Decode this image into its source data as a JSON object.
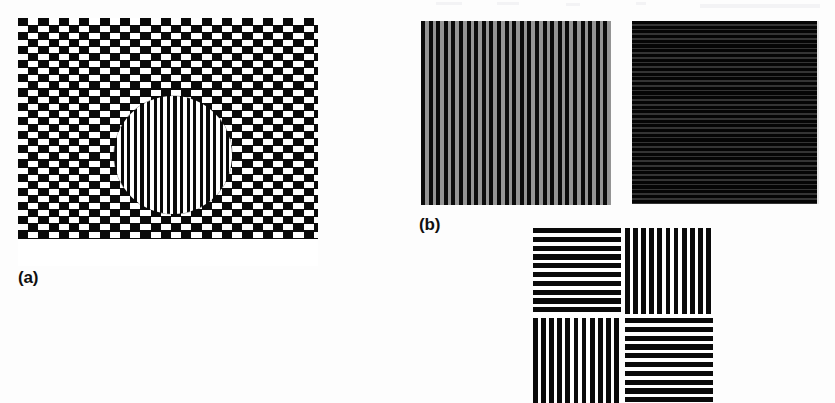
{
  "figure": {
    "background_color": "#fdfdfd",
    "width": 835,
    "height": 403,
    "panel_labels": [
      {
        "id": "a",
        "text": "(a)"
      },
      {
        "id": "b",
        "text": "(b)"
      }
    ]
  },
  "panel_a": {
    "label": "(a)",
    "name": "offset-checkerboard-with-circular-grating-inset",
    "description": "Large offset (cafe-wall style) black and white checkerboard with a circular inset containing a fine vertical square-wave grating",
    "colors": {
      "bar": "#0a0a0a",
      "background": "#ffffff"
    },
    "geometry": {
      "left": 18,
      "top": 18,
      "width": 300,
      "height": 248,
      "cell_width_px": 20.4,
      "row_height_px": 7.1,
      "row_offset_px": 10.2,
      "row_count": 31
    },
    "inset": {
      "shape": "circle",
      "left": 96,
      "top": 78,
      "diameter_px": 118,
      "grating_orientation": "vertical",
      "grating_period_px": 6.6
    }
  },
  "panel_b": {
    "label": "(b)",
    "name": "grating-pair-and-quad",
    "gratings": [
      {
        "id": "vertical-grating-gray",
        "orientation": "vertical",
        "bar_color": "#0b0b0b",
        "background_color": "#949494",
        "period_px": 7.6,
        "bar_count": 25,
        "left": 421,
        "top": 21,
        "width": 190,
        "height": 184
      },
      {
        "id": "horizontal-grating-dark",
        "orientation": "horizontal",
        "bar_color": "#050505",
        "background_color": "#343434",
        "period_px": 4.7,
        "bar_count": 39,
        "left": 632,
        "top": 21,
        "width": 187,
        "height": 183
      }
    ],
    "quad": {
      "id": "orthogonal-grating-quad",
      "description": "Two by two arrangement of square grating patches with alternating orientation",
      "left": 533,
      "top": 228,
      "width": 180,
      "height": 175,
      "cells": [
        {
          "position": "top-left",
          "orientation": "horizontal",
          "period_px": 8.8,
          "bar_count": 10
        },
        {
          "position": "top-right",
          "orientation": "vertical",
          "period_px": 8.1,
          "bar_count": 11
        },
        {
          "position": "bottom-left",
          "orientation": "vertical",
          "period_px": 8.1,
          "bar_count": 11
        },
        {
          "position": "bottom-right",
          "orientation": "horizontal",
          "period_px": 8.8,
          "bar_count": 10
        }
      ],
      "colors": {
        "bar": "#0a0a0a",
        "background": "#ffffff"
      },
      "clipped_at_bottom": true
    }
  }
}
